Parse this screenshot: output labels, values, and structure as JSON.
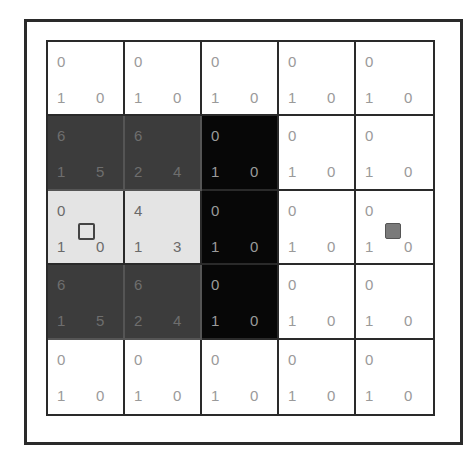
{
  "diagram": {
    "type": "grid-world-value-table",
    "rows": 5,
    "cols": 5,
    "cells": [
      [
        {
          "top": "0",
          "bottom_left": "1",
          "bottom_right": "0",
          "shade": "white"
        },
        {
          "top": "0",
          "bottom_left": "1",
          "bottom_right": "0",
          "shade": "white"
        },
        {
          "top": "0",
          "bottom_left": "1",
          "bottom_right": "0",
          "shade": "white"
        },
        {
          "top": "0",
          "bottom_left": "1",
          "bottom_right": "0",
          "shade": "white"
        },
        {
          "top": "0",
          "bottom_left": "1",
          "bottom_right": "0",
          "shade": "white"
        }
      ],
      [
        {
          "top": "6",
          "bottom_left": "1",
          "bottom_right": "5",
          "shade": "dark"
        },
        {
          "top": "6",
          "bottom_left": "2",
          "bottom_right": "4",
          "shade": "dark"
        },
        {
          "top": "0",
          "bottom_left": "1",
          "bottom_right": "0",
          "shade": "black"
        },
        {
          "top": "0",
          "bottom_left": "1",
          "bottom_right": "0",
          "shade": "white"
        },
        {
          "top": "0",
          "bottom_left": "1",
          "bottom_right": "0",
          "shade": "white"
        }
      ],
      [
        {
          "top": "0",
          "bottom_left": "1",
          "bottom_right": "0",
          "shade": "light",
          "marker": "hollow-square"
        },
        {
          "top": "4",
          "bottom_left": "1",
          "bottom_right": "3",
          "shade": "light"
        },
        {
          "top": "0",
          "bottom_left": "1",
          "bottom_right": "0",
          "shade": "black"
        },
        {
          "top": "0",
          "bottom_left": "1",
          "bottom_right": "0",
          "shade": "white"
        },
        {
          "top": "0",
          "bottom_left": "1",
          "bottom_right": "0",
          "shade": "white",
          "marker": "filled-square"
        }
      ],
      [
        {
          "top": "6",
          "bottom_left": "1",
          "bottom_right": "5",
          "shade": "dark"
        },
        {
          "top": "6",
          "bottom_left": "2",
          "bottom_right": "4",
          "shade": "dark"
        },
        {
          "top": "0",
          "bottom_left": "1",
          "bottom_right": "0",
          "shade": "black"
        },
        {
          "top": "0",
          "bottom_left": "1",
          "bottom_right": "0",
          "shade": "white"
        },
        {
          "top": "0",
          "bottom_left": "1",
          "bottom_right": "0",
          "shade": "white"
        }
      ],
      [
        {
          "top": "0",
          "bottom_left": "1",
          "bottom_right": "0",
          "shade": "white"
        },
        {
          "top": "0",
          "bottom_left": "1",
          "bottom_right": "0",
          "shade": "white"
        },
        {
          "top": "0",
          "bottom_left": "1",
          "bottom_right": "0",
          "shade": "white"
        },
        {
          "top": "0",
          "bottom_left": "1",
          "bottom_right": "0",
          "shade": "white"
        },
        {
          "top": "0",
          "bottom_left": "1",
          "bottom_right": "0",
          "shade": "white"
        }
      ]
    ],
    "colors": {
      "white": "#ffffff",
      "dark": "#3c3c3c",
      "black": "#070707",
      "light": "#e4e4e4",
      "border": "#2a2a2a"
    }
  }
}
